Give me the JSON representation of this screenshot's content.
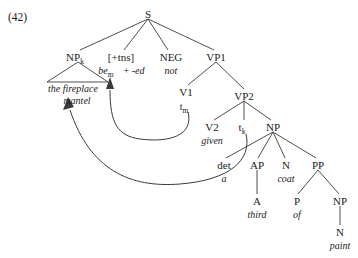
{
  "figure": {
    "example_number": "(42)",
    "type": "syntax-tree",
    "sentence": "the fireplace mantel be + -ed not given a third coat of paint"
  },
  "nodes": {
    "s": {
      "label": "S",
      "x": 148,
      "y": 14
    },
    "np_k": {
      "label": "NP",
      "sub": "k",
      "x": 78,
      "y": 57
    },
    "tns": {
      "label": "[+tns]",
      "x": 121,
      "y": 57
    },
    "neg": {
      "label": "NEG",
      "x": 171,
      "y": 57
    },
    "vp1": {
      "label": "VP1",
      "x": 216,
      "y": 57
    },
    "v1": {
      "label": "V1",
      "x": 186,
      "y": 92
    },
    "vp2": {
      "label": "VP2",
      "x": 244,
      "y": 96
    },
    "v2": {
      "label": "V2",
      "x": 212,
      "y": 127
    },
    "t_k": {
      "label": "t",
      "sub": "k",
      "x": 244,
      "y": 127
    },
    "np": {
      "label": "NP",
      "x": 273,
      "y": 127
    },
    "det": {
      "label": "det",
      "x": 224,
      "y": 165
    },
    "ap": {
      "label": "AP",
      "x": 257,
      "y": 165
    },
    "n_coat": {
      "label": "N",
      "x": 286,
      "y": 165
    },
    "pp": {
      "label": "PP",
      "x": 318,
      "y": 165
    },
    "a_adj": {
      "label": "A",
      "x": 257,
      "y": 201
    },
    "p": {
      "label": "P",
      "x": 297,
      "y": 201
    },
    "np_paint": {
      "label": "NP",
      "x": 340,
      "y": 201
    },
    "n_paint": {
      "label": "N",
      "x": 340,
      "y": 232
    }
  },
  "terminals": {
    "np_k_line1": {
      "text": "the fireplace",
      "x": 73,
      "y": 84
    },
    "np_k_line2": {
      "text": "mantel",
      "x": 77,
      "y": 97
    },
    "tns_aux": {
      "text": "be",
      "x": 106,
      "y": 70
    },
    "tns_aux_sub": {
      "text": "m",
      "x": 114,
      "y": 72
    },
    "tns_affix": {
      "text": "+ -ed",
      "x": 133,
      "y": 70
    },
    "neg_not": {
      "text": "not",
      "x": 171,
      "y": 70
    },
    "v1_trace": {
      "text": "t",
      "x": 184,
      "y": 106
    },
    "v1_trace_sub": {
      "text": "m",
      "x": 189,
      "y": 108
    },
    "v2_given": {
      "text": "given",
      "x": 212,
      "y": 140
    },
    "det_a": {
      "text": "a",
      "x": 224,
      "y": 178
    },
    "n_coat_word": {
      "text": "coat",
      "x": 286,
      "y": 178
    },
    "a_third": {
      "text": "third",
      "x": 257,
      "y": 214
    },
    "p_of": {
      "text": "of",
      "x": 297,
      "y": 214
    },
    "n_paint_word": {
      "text": "paint",
      "x": 340,
      "y": 245
    }
  },
  "movement_arrows": [
    {
      "name": "head-movement-be",
      "from": "t_m",
      "to": "be_m"
    },
    {
      "name": "np-movement-mantel",
      "from": "t_k",
      "to": "NP_k"
    }
  ],
  "colors": {
    "ink": "#1a1a1a",
    "line": "#3a3a3a",
    "background": "#ffffff"
  }
}
